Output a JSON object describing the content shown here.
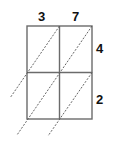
{
  "diagram": {
    "type": "lattice-multiplication-grid",
    "top_digits": [
      "3",
      "7"
    ],
    "right_digits": [
      "4",
      "2"
    ],
    "rows": 2,
    "cols": 2,
    "colors": {
      "grid": "#6b6b6b",
      "diagonal": "#555555",
      "text": "#111111"
    }
  }
}
